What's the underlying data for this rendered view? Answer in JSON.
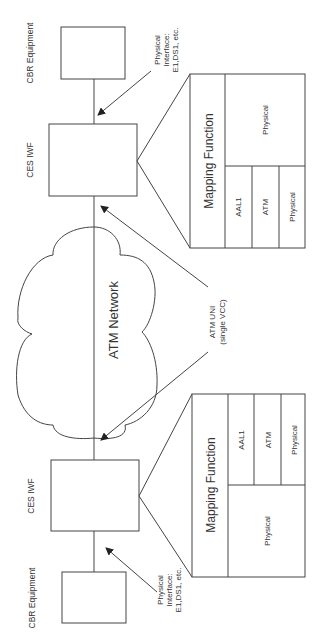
{
  "diagram": {
    "orientation": "rotated-90-ccw",
    "top_side": {
      "cbr_label": "CBR Equipment",
      "iwf_label": "CES IWF",
      "phys_if_line1": "Physical",
      "phys_if_line2": "Interface:",
      "phys_if_line3": "E1,DS1, etc.",
      "mapping": {
        "title": "Mapping Function",
        "cbr_side_layer": "Physical",
        "atm_stack": [
          "AAL1",
          "ATM",
          "Physical"
        ]
      }
    },
    "network": {
      "label": "ATM Network"
    },
    "uni": {
      "line1": "ATM UNI",
      "line2": "(single VCC)"
    },
    "bottom_side": {
      "cbr_label": "CBR Equipment",
      "iwf_label": "CES IWF",
      "phys_if_line1": "Physical",
      "phys_if_line2": "Interface:",
      "phys_if_line3": "E1,DS1, etc.",
      "mapping": {
        "title": "Mapping Function",
        "cbr_side_layer": "Physical",
        "atm_stack": [
          "AAL1",
          "ATM",
          "Physical"
        ]
      }
    },
    "colors": {
      "line": "#444444",
      "text": "#333333",
      "background": "#ffffff"
    }
  }
}
